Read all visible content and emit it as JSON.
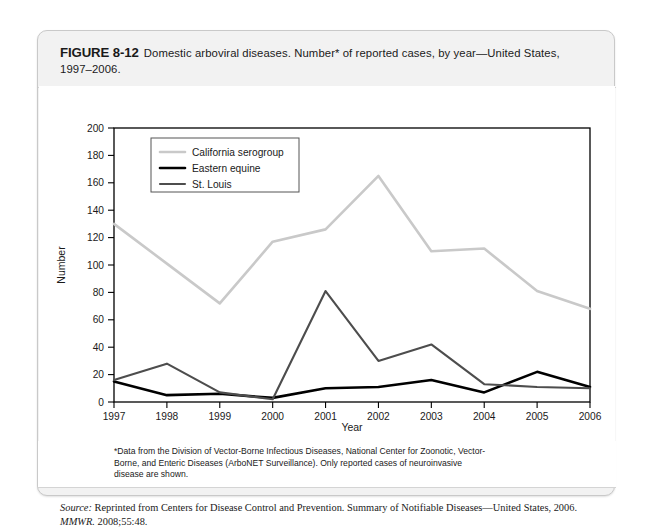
{
  "figure": {
    "label": "FIGURE 8-12",
    "caption_line1": "Domestic arboviral diseases. Number* of reported cases, by year—United States,",
    "caption_line2": "1997–2006."
  },
  "footnote": {
    "line1": "*Data from the Division of Vector-Borne Infectious Diseases, National Center for Zoonotic, Vector-",
    "line2": "Borne, and Enteric Diseases (ArboNET Surveillance). Only reported cases of neuroinvasive",
    "line3": "disease are shown."
  },
  "source": {
    "prefix": "Source:",
    "text1": " Reprinted from Centers for Disease Control and Prevention. Summary of Notifiable Diseases—United States, 2006. ",
    "journal": "MMWR.",
    "text2": " 2008;55:48."
  },
  "chart_data": {
    "type": "line",
    "title": "",
    "xlabel": "Year",
    "ylabel": "Number",
    "categories": [
      "1997",
      "1998",
      "1999",
      "2000",
      "2001",
      "2002",
      "2003",
      "2004",
      "2005",
      "2006"
    ],
    "x": [
      1997,
      1998,
      1999,
      2000,
      2001,
      2002,
      2003,
      2004,
      2005,
      2006
    ],
    "xlim": [
      1997,
      2006
    ],
    "ylim": [
      0,
      200
    ],
    "yticks": [
      0,
      20,
      40,
      60,
      80,
      100,
      120,
      140,
      160,
      180,
      200
    ],
    "xticks": [
      1997,
      1998,
      1999,
      2000,
      2001,
      2002,
      2003,
      2004,
      2005,
      2006
    ],
    "grid": false,
    "legend_position": "top-left",
    "series": [
      {
        "name": "California serogroup",
        "color": "#c9c9c9",
        "width": 2.6,
        "values": [
          130,
          101,
          72,
          117,
          126,
          165,
          110,
          112,
          81,
          68
        ]
      },
      {
        "name": "Eastern equine",
        "color": "#000000",
        "width": 2.6,
        "values": [
          15,
          5,
          6,
          3,
          10,
          11,
          16,
          7,
          22,
          11
        ]
      },
      {
        "name": "St. Louis",
        "color": "#4d4d4d",
        "width": 2.1,
        "values": [
          16,
          28,
          7,
          2,
          81,
          30,
          42,
          13,
          11,
          10
        ]
      }
    ]
  }
}
